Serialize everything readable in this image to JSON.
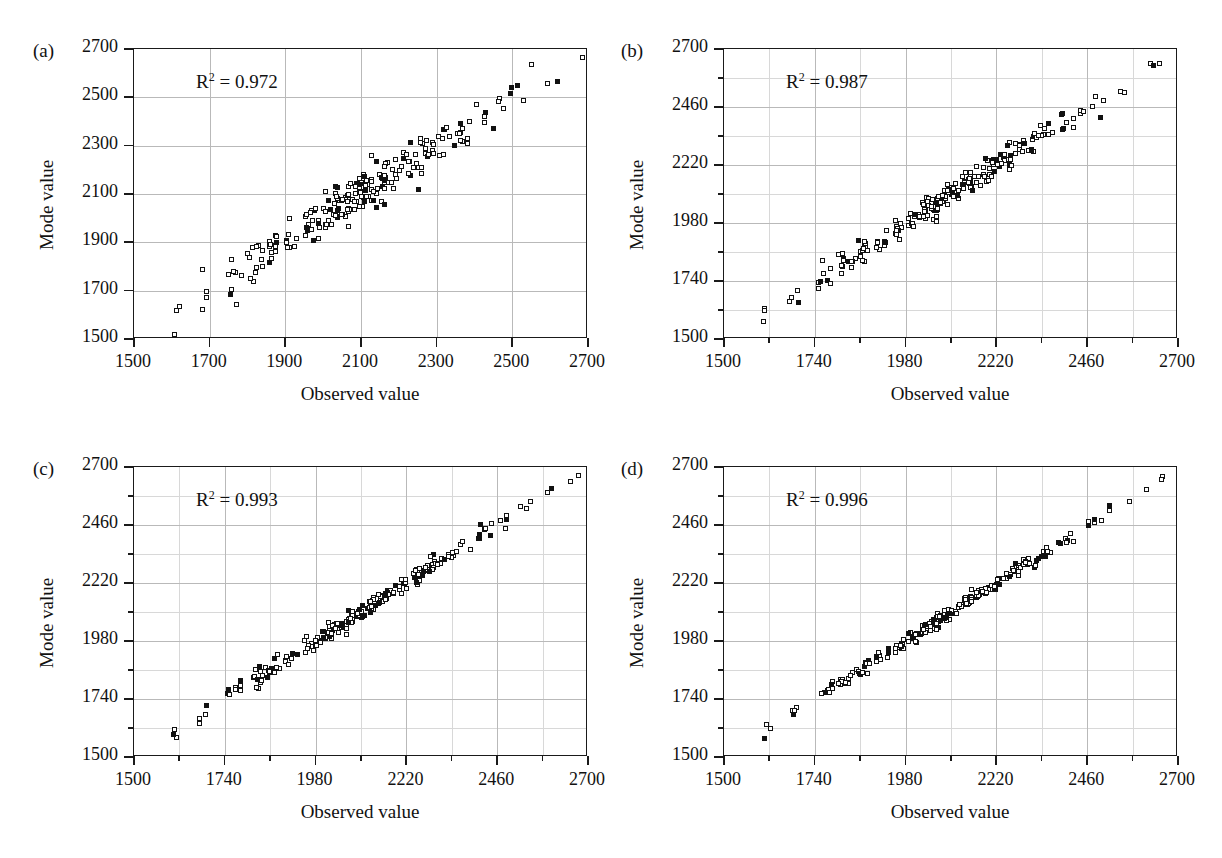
{
  "figure": {
    "title": "",
    "panel_count": 4
  },
  "chart_data": [
    {
      "type": "scatter",
      "panel": "(a)",
      "title": "",
      "xlabel": "Observed value",
      "ylabel": "Mode value",
      "annotation": "R² = 0.972",
      "r_squared": 0.972,
      "xlim": [
        1500,
        2700
      ],
      "ylim": [
        1500,
        2700
      ],
      "xticks": [
        1500,
        1700,
        1900,
        2100,
        2300,
        2500,
        2700
      ],
      "yticks": [
        1500,
        1700,
        1900,
        2100,
        2300,
        2500,
        2700
      ],
      "xtick_labels": [
        "1500",
        "1700",
        "1900",
        "2100",
        "2300",
        "2500",
        "2700"
      ],
      "ytick_labels": [
        "1500",
        "1700",
        "1900",
        "2100",
        "2300",
        "2500",
        "2700"
      ],
      "minor_ticks": false,
      "grid": true,
      "legend": "none",
      "scatter_noise": 46,
      "point_count": 232,
      "seed": 17
    },
    {
      "type": "scatter",
      "panel": "(b)",
      "title": "",
      "xlabel": "Observed value",
      "ylabel": "Mode value",
      "annotation": "R² = 0.987",
      "r_squared": 0.987,
      "xlim": [
        1500,
        2700
      ],
      "ylim": [
        1500,
        2700
      ],
      "xticks": [
        1500,
        1740,
        1980,
        2220,
        2460,
        2700
      ],
      "yticks": [
        1500,
        1740,
        1980,
        2220,
        2460,
        2700
      ],
      "xtick_labels": [
        "1500",
        "1740",
        "1980",
        "2220",
        "2460",
        "2700"
      ],
      "ytick_labels": [
        "1500",
        "1740",
        "1980",
        "2220",
        "2460",
        "2700"
      ],
      "minor_ticks": true,
      "grid": true,
      "legend": "none",
      "scatter_noise": 27,
      "point_count": 232,
      "seed": 43
    },
    {
      "type": "scatter",
      "panel": "(c)",
      "title": "",
      "xlabel": "Observed value",
      "ylabel": "Mode value",
      "annotation": "R² = 0.993",
      "r_squared": 0.993,
      "xlim": [
        1500,
        2700
      ],
      "ylim": [
        1500,
        2700
      ],
      "xticks": [
        1500,
        1740,
        1980,
        2220,
        2460,
        2700
      ],
      "yticks": [
        1500,
        1740,
        1980,
        2220,
        2460,
        2700
      ],
      "xtick_labels": [
        "1500",
        "1740",
        "1980",
        "2220",
        "2460",
        "2700"
      ],
      "ytick_labels": [
        "1500",
        "1740",
        "1980",
        "2220",
        "2460",
        "2700"
      ],
      "minor_ticks": true,
      "grid": true,
      "legend": "none",
      "scatter_noise": 19,
      "point_count": 232,
      "seed": 91
    },
    {
      "type": "scatter",
      "panel": "(d)",
      "title": "",
      "xlabel": "Observed value",
      "ylabel": "Mode value",
      "annotation": "R² = 0.996",
      "r_squared": 0.996,
      "xlim": [
        1500,
        2700
      ],
      "ylim": [
        1500,
        2700
      ],
      "xticks": [
        1500,
        1740,
        1980,
        2220,
        2460,
        2700
      ],
      "yticks": [
        1500,
        1740,
        1980,
        2220,
        2460,
        2700
      ],
      "xtick_labels": [
        "1500",
        "1740",
        "1980",
        "2220",
        "2460",
        "2700"
      ],
      "ytick_labels": [
        "1500",
        "1740",
        "1980",
        "2220",
        "2460",
        "2700"
      ],
      "minor_ticks": true,
      "grid": true,
      "legend": "none",
      "scatter_noise": 13,
      "point_count": 232,
      "seed": 128
    }
  ],
  "style": {
    "axis_color": "#1a1a1a",
    "grid_color": "#b9b9b9",
    "marker_edge_color": "#111111",
    "marker_face_color": "#ffffff",
    "background": "#ffffff"
  }
}
